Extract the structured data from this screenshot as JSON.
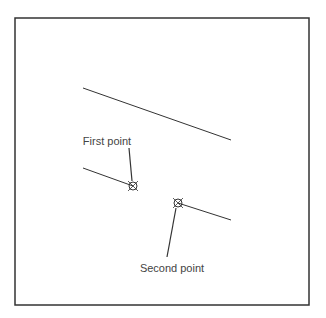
{
  "diagram": {
    "frame": {
      "x": 15,
      "y": 18,
      "width": 294,
      "height": 287,
      "stroke": "#333333"
    },
    "lines": [
      {
        "name": "upper-line",
        "x1": 83,
        "y1": 88,
        "x2": 231,
        "y2": 140
      },
      {
        "name": "lower-left-line",
        "x1": 83,
        "y1": 168,
        "x2": 133,
        "y2": 186
      },
      {
        "name": "lower-right-line",
        "x1": 178,
        "y1": 203,
        "x2": 231,
        "y2": 220
      }
    ],
    "points": [
      {
        "name": "first-point",
        "label": "First point",
        "x": 133,
        "y": 186,
        "label_x": 107,
        "label_y": 135,
        "leader_from": [
          129,
          148
        ]
      },
      {
        "name": "second-point",
        "label": "Second point",
        "x": 178,
        "y": 203,
        "label_x": 172,
        "label_y": 262,
        "leader_from": [
          167,
          257
        ]
      }
    ]
  }
}
